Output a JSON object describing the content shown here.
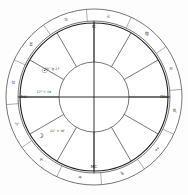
{
  "chart": {
    "type": "astrological-wheel",
    "center": {
      "x": 94,
      "y": 97
    },
    "radii": {
      "outer_ring_outer": 88,
      "outer_ring_inner": 76,
      "house_wheel_outer": 74,
      "inner_circle": 35
    },
    "background_color": "#fdfdfd",
    "line_color": "#3a3a3a",
    "glyph_color": "#2a2a2a"
  },
  "zodiac_signs": [
    {
      "name": "Aries",
      "glyph": "♈",
      "angle_deg": 200
    },
    {
      "name": "Taurus",
      "glyph": "♉",
      "angle_deg": 170
    },
    {
      "name": "Gemini",
      "glyph": "♊",
      "angle_deg": 140
    },
    {
      "name": "Cancer",
      "glyph": "♋",
      "angle_deg": 110
    },
    {
      "name": "Leo",
      "glyph": "♌",
      "angle_deg": 80
    },
    {
      "name": "Virgo",
      "glyph": "♍",
      "angle_deg": 50
    },
    {
      "name": "Libra",
      "glyph": "♎",
      "angle_deg": 20
    },
    {
      "name": "Scorpio",
      "glyph": "♏",
      "angle_deg": 350
    },
    {
      "name": "Sagittarius",
      "glyph": "♐",
      "angle_deg": 320
    },
    {
      "name": "Capricorn",
      "glyph": "♑",
      "angle_deg": 290
    },
    {
      "name": "Aquarius",
      "glyph": "♒",
      "angle_deg": 260
    },
    {
      "name": "Pisces",
      "glyph": "♓",
      "angle_deg": 230
    }
  ],
  "house_cusps": [
    {
      "house": 1,
      "angle_deg": 180
    },
    {
      "house": 2,
      "angle_deg": 150
    },
    {
      "house": 3,
      "angle_deg": 120
    },
    {
      "house": 4,
      "angle_deg": 90
    },
    {
      "house": 5,
      "angle_deg": 60
    },
    {
      "house": 6,
      "angle_deg": 30
    },
    {
      "house": 7,
      "angle_deg": 0
    },
    {
      "house": 8,
      "angle_deg": 330
    },
    {
      "house": 9,
      "angle_deg": 300
    },
    {
      "house": 10,
      "angle_deg": 270
    },
    {
      "house": 11,
      "angle_deg": 240
    },
    {
      "house": 12,
      "angle_deg": 210
    }
  ],
  "planets": [
    {
      "name": "Sun",
      "glyph": "☉",
      "angle_deg": 152,
      "radius": 56,
      "degree_label": "15° ♍ 27'",
      "label_angle_deg": 146,
      "label_radius": 50
    },
    {
      "name": "Moon",
      "glyph": "☽",
      "angle_deg": 216,
      "radius": 66,
      "degree_label": "21° ♓ 18'",
      "label_angle_deg": 223,
      "label_radius": 50
    }
  ],
  "angles": [
    {
      "name": "Ascendant",
      "abbr": "Asc",
      "angle_deg": 180,
      "degree_label": "17° ♈ 19'"
    },
    {
      "name": "Descendant",
      "abbr": "Dsc",
      "angle_deg": 0,
      "degree_label": ""
    },
    {
      "name": "Midheaven",
      "abbr": "MC",
      "angle_deg": 270,
      "degree_label": ""
    },
    {
      "name": "Imum Coeli",
      "abbr": "IC",
      "angle_deg": 90,
      "degree_label": ""
    }
  ],
  "chart_data": {
    "type": "pie",
    "xlabel": "",
    "ylabel": "",
    "categories": [
      "Aries",
      "Taurus",
      "Gemini",
      "Cancer",
      "Leo",
      "Virgo",
      "Libra",
      "Scorpio",
      "Sagittarius",
      "Capricorn",
      "Aquarius",
      "Pisces"
    ],
    "values": [
      30,
      30,
      30,
      30,
      30,
      30,
      30,
      30,
      30,
      30,
      30,
      30
    ],
    "legend_position": "none",
    "grid": false,
    "annotations": [
      "Sun 15° Virgo 27'",
      "Moon 21° Pisces 18'",
      "Ascendant 17° Aries 19'"
    ]
  }
}
